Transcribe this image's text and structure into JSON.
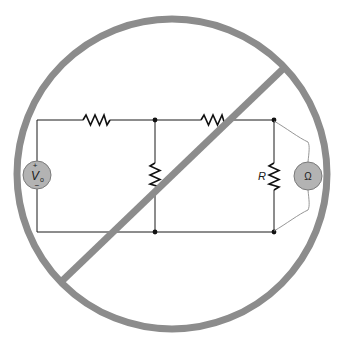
{
  "diagram": {
    "colors": {
      "prohibition": "#8c8c8c",
      "wire": "#1a1a1a",
      "meter_fill": "#b3b3b3",
      "lead": "#8a8a8a",
      "background": "#ffffff"
    },
    "components": {
      "source": {
        "type": "voltage-source",
        "label": "V",
        "subscript": "o",
        "plus": "+",
        "minus": "−"
      },
      "resistors": [
        {
          "id": "r1",
          "orientation": "horizontal",
          "position": "top-left",
          "label": ""
        },
        {
          "id": "r2",
          "orientation": "vertical",
          "position": "middle",
          "label": ""
        },
        {
          "id": "r3",
          "orientation": "horizontal",
          "position": "top-right",
          "label": ""
        },
        {
          "id": "r-measured",
          "orientation": "vertical",
          "position": "right",
          "label": "R"
        }
      ],
      "meter": {
        "type": "ohmmeter",
        "symbol": "Ω"
      },
      "nodes": 4
    },
    "overlay": {
      "type": "prohibition-sign",
      "meaning": "Do not measure resistance with circuit powered"
    }
  }
}
